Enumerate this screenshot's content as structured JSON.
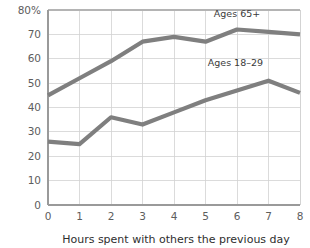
{
  "chart_data": {
    "type": "line",
    "title": "",
    "xlabel": "Hours spent with others the previous day",
    "ylabel": "",
    "x": [
      0,
      1,
      2,
      3,
      4,
      5,
      6,
      7,
      8
    ],
    "xtick_labels": [
      "0",
      "1",
      "2",
      "3",
      "4",
      "5",
      "6",
      "7",
      "8"
    ],
    "ytick_labels": [
      "0",
      "10",
      "20",
      "30",
      "40",
      "50",
      "60",
      "70",
      "80%"
    ],
    "ytick_values": [
      0,
      10,
      20,
      30,
      40,
      50,
      60,
      70,
      80
    ],
    "ylim": [
      0,
      80
    ],
    "xlim": [
      0,
      8
    ],
    "grid": true,
    "legend_position": "inline-annotations",
    "series": [
      {
        "name": "Ages 65+",
        "color": "#7f7f7f",
        "values": [
          45,
          52,
          59,
          67,
          69,
          67,
          72,
          71,
          70
        ],
        "annotation": "Ages 65+",
        "annotation_x": 6,
        "annotation_y": 77
      },
      {
        "name": "Ages 18–29",
        "color": "#7f7f7f",
        "values": [
          26,
          25,
          36,
          33,
          38,
          43,
          47,
          51,
          46
        ],
        "annotation": "Ages 18–29",
        "annotation_x": 5.95,
        "annotation_y": 57
      }
    ]
  },
  "colors": {
    "line": "#7f7f7f",
    "grid": "#d2d2d2",
    "border": "#b4b4b4",
    "axis": "#9a9a9a",
    "tick_text": "#5d5d5d",
    "title_text": "#2e2e2e",
    "background": "#ffffff"
  }
}
